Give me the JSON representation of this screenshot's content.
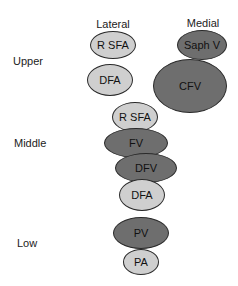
{
  "diagram": {
    "column_headers": [
      {
        "label": "Lateral",
        "x": 113,
        "y": 24
      },
      {
        "label": "Medial",
        "x": 203,
        "y": 23
      }
    ],
    "row_labels": [
      {
        "label": "Upper",
        "x": 13,
        "y": 61
      },
      {
        "label": "Middle",
        "x": 14,
        "y": 143
      },
      {
        "label": "Low",
        "x": 17,
        "y": 243
      }
    ],
    "colors": {
      "artery_fill": "#cfcfcf",
      "vein_fill": "#6e6e6e",
      "outline": "#2a2a2a"
    },
    "vessels": [
      {
        "label": "R SFA",
        "type": "artery",
        "level": "upper",
        "side": "lateral",
        "cx": 113,
        "cy": 45,
        "w": 46,
        "h": 28
      },
      {
        "label": "DFA",
        "type": "artery",
        "level": "upper",
        "side": "lateral",
        "cx": 110,
        "cy": 80,
        "w": 46,
        "h": 32
      },
      {
        "label": "Saph V",
        "type": "vein",
        "level": "upper",
        "side": "medial",
        "cx": 202,
        "cy": 45,
        "w": 50,
        "h": 30
      },
      {
        "label": "CFV",
        "type": "vein",
        "level": "upper",
        "side": "medial",
        "cx": 190,
        "cy": 86,
        "w": 74,
        "h": 54
      },
      {
        "label": "R SFA",
        "type": "artery",
        "level": "middle",
        "cx": 135,
        "cy": 117,
        "w": 46,
        "h": 30
      },
      {
        "label": "FV",
        "type": "vein",
        "level": "middle",
        "cx": 136,
        "cy": 143,
        "w": 64,
        "h": 30
      },
      {
        "label": "DFV",
        "type": "vein",
        "level": "middle",
        "cx": 146,
        "cy": 168,
        "w": 62,
        "h": 30
      },
      {
        "label": "DFA",
        "type": "artery",
        "level": "middle",
        "cx": 142,
        "cy": 195,
        "w": 46,
        "h": 32
      },
      {
        "label": "PV",
        "type": "vein",
        "level": "low",
        "cx": 141,
        "cy": 233,
        "w": 56,
        "h": 32
      },
      {
        "label": "PA",
        "type": "artery",
        "level": "low",
        "cx": 141,
        "cy": 262,
        "w": 36,
        "h": 26
      }
    ]
  }
}
